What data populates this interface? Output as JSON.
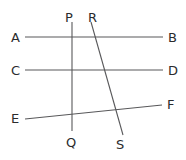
{
  "figure": {
    "name": "transversal-lines-figure",
    "width": 186,
    "height": 160,
    "background_color": "#ffffff",
    "line_color": "#58585a",
    "label_color": "#2b2b2d",
    "lines": [
      {
        "id": "AB",
        "from_label": "A",
        "to_label": "B",
        "x1": 25,
        "y1": 37,
        "x2": 163,
        "y2": 37,
        "orientation": "horizontal"
      },
      {
        "id": "CD",
        "from_label": "C",
        "to_label": "D",
        "x1": 25,
        "y1": 70,
        "x2": 163,
        "y2": 70,
        "orientation": "horizontal"
      },
      {
        "id": "EF",
        "from_label": "E",
        "to_label": "F",
        "x1": 25,
        "y1": 119,
        "x2": 162,
        "y2": 105,
        "orientation": "slanted"
      },
      {
        "id": "PQ",
        "from_label": "P",
        "to_label": "Q",
        "x1": 72,
        "y1": 22,
        "x2": 72,
        "y2": 131,
        "orientation": "vertical"
      },
      {
        "id": "RS",
        "from_label": "R",
        "to_label": "S",
        "x1": 91,
        "y1": 22,
        "x2": 123,
        "y2": 135,
        "orientation": "slanted"
      }
    ],
    "labels": [
      {
        "id": "label-P",
        "text": "P",
        "x": 65,
        "y": 11
      },
      {
        "id": "label-R",
        "text": "R",
        "x": 88,
        "y": 11
      },
      {
        "id": "label-A",
        "text": "A",
        "x": 11,
        "y": 31
      },
      {
        "id": "label-B",
        "text": "B",
        "x": 168,
        "y": 31
      },
      {
        "id": "label-C",
        "text": "C",
        "x": 11,
        "y": 64
      },
      {
        "id": "label-D",
        "text": "D",
        "x": 168,
        "y": 64
      },
      {
        "id": "label-E",
        "text": "E",
        "x": 11,
        "y": 112
      },
      {
        "id": "label-F",
        "text": "F",
        "x": 167,
        "y": 98
      },
      {
        "id": "label-Q",
        "text": "Q",
        "x": 66,
        "y": 136
      },
      {
        "id": "label-S",
        "text": "S",
        "x": 116,
        "y": 138
      }
    ]
  }
}
